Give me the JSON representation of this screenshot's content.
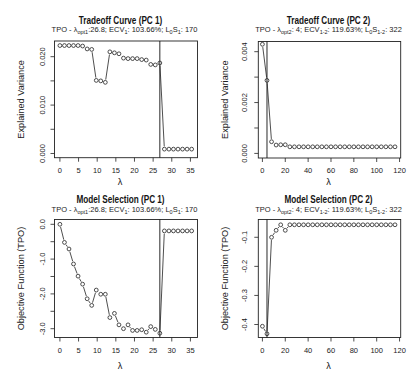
{
  "figure": {
    "background": "#ffffff",
    "ink": "#222222",
    "layout": "2x2 panels"
  },
  "chart_data": [
    {
      "id": "tradeoff-pc1",
      "type": "line",
      "marker": "open-circle",
      "title": "Tradeoff Curve (PC 1)",
      "subtitle_parts": [
        "TPO - λ",
        "opt1",
        ":26.8; ECV",
        "1",
        ": 103.66%; L",
        "0",
        "S",
        "1",
        ": 170"
      ],
      "xlabel": "λ",
      "ylabel": "Explained Variance",
      "x": [
        0,
        1.22,
        2.44,
        3.65,
        4.87,
        6.09,
        7.31,
        8.53,
        9.75,
        10.96,
        12.18,
        13.4,
        14.62,
        15.84,
        17.05,
        18.27,
        19.49,
        20.71,
        21.93,
        23.15,
        24.36,
        25.58,
        26.8,
        28.02,
        29.24,
        30.45,
        31.67,
        32.89,
        34.11,
        35.33
      ],
      "y": [
        0.0223,
        0.0223,
        0.0223,
        0.0223,
        0.0223,
        0.0222,
        0.0216,
        0.0215,
        0.0151,
        0.015,
        0.0147,
        0.021,
        0.0208,
        0.0206,
        0.0197,
        0.0196,
        0.0196,
        0.0196,
        0.0194,
        0.0193,
        0.0184,
        0.0183,
        0.0187,
        0.0009,
        0.0009,
        0.0009,
        0.0009,
        0.0009,
        0.0009,
        0.0009
      ],
      "xlim": [
        -1.45,
        36.9
      ],
      "ylim": [
        -0.00087,
        0.02324
      ],
      "xticks": [
        0,
        5,
        10,
        15,
        20,
        25,
        30,
        35
      ],
      "xtick_labels": [
        "0",
        "5",
        "10",
        "15",
        "20",
        "25",
        "30",
        "35"
      ],
      "yticks": [
        0,
        0.005,
        0.01,
        0.015,
        0.02
      ],
      "ytick_labels": [
        "0.000",
        "",
        "0.010",
        "",
        "0.020"
      ],
      "vline_x": 26.8,
      "grid": false,
      "legend": "none"
    },
    {
      "id": "tradeoff-pc2",
      "type": "line",
      "marker": "open-circle",
      "title": "Tradeoff Curve (PC 2)",
      "subtitle_parts": [
        "TPO - λ",
        "opt2",
        ": 4; ECV",
        "1-2",
        ": 119.63%; L",
        "0",
        "S",
        "1-2",
        ": 322"
      ],
      "xlabel": "λ",
      "ylabel": "Explained Variance",
      "x": [
        0,
        4,
        8,
        12,
        16,
        20,
        24,
        28,
        32,
        36,
        40,
        44,
        48,
        52,
        56,
        60,
        64,
        68,
        72,
        76,
        80,
        84,
        88,
        92,
        96,
        100,
        104,
        108,
        112,
        116
      ],
      "y": [
        0.00429,
        0.00287,
        0.00046,
        0.00033,
        0.00034,
        0.00034,
        0.00026,
        0.00026,
        0.00026,
        0.00026,
        0.00026,
        0.00026,
        0.00026,
        0.00026,
        0.00026,
        0.00026,
        0.00026,
        0.00026,
        0.00026,
        0.00026,
        0.00026,
        0.00026,
        0.00026,
        0.00026,
        0.00026,
        0.00026,
        0.00026,
        0.00026,
        0.00026,
        0.00026
      ],
      "xlim": [
        -3.6,
        121.0
      ],
      "ylim": [
        -0.00018,
        0.0044
      ],
      "xticks": [
        0,
        20,
        40,
        60,
        80,
        100,
        120
      ],
      "xtick_labels": [
        "0",
        "20",
        "40",
        "60",
        "80",
        "100",
        "120"
      ],
      "yticks": [
        0,
        0.001,
        0.002,
        0.003,
        0.004
      ],
      "ytick_labels": [
        "0.000",
        "",
        "0.002",
        "",
        "0.004"
      ],
      "vline_x": 4,
      "grid": false,
      "legend": "none"
    },
    {
      "id": "model-selection-pc1",
      "type": "line",
      "marker": "open-circle",
      "title": "Model Selection (PC 1)",
      "subtitle_parts": [
        "TPO - λ",
        "opt1",
        ":26.8; ECV",
        "1",
        ": 103.66%; L",
        "0",
        "S",
        "1",
        ": 170"
      ],
      "xlabel": "λ",
      "ylabel": "Objective Function (TPO)",
      "x": [
        0,
        1.22,
        2.44,
        3.65,
        4.87,
        6.09,
        7.31,
        8.53,
        9.75,
        10.96,
        12.18,
        13.4,
        14.62,
        15.84,
        17.05,
        18.27,
        19.49,
        20.71,
        21.93,
        23.15,
        24.36,
        25.58,
        26.8,
        28.02,
        29.24,
        30.45,
        31.67,
        32.89,
        34.11,
        35.33
      ],
      "y": [
        0.0,
        -0.52,
        -0.71,
        -1.14,
        -1.49,
        -1.72,
        -2.14,
        -2.33,
        -1.89,
        -2.01,
        -2.01,
        -2.68,
        -2.56,
        -2.89,
        -3.0,
        -2.89,
        -3.05,
        -3.05,
        -3.03,
        -3.1,
        -2.94,
        -3.02,
        -3.13,
        -0.19,
        -0.19,
        -0.19,
        -0.19,
        -0.19,
        -0.19,
        -0.19
      ],
      "xlim": [
        -1.45,
        36.9
      ],
      "ylim": [
        -3.253,
        0.138
      ],
      "xticks": [
        0,
        5,
        10,
        15,
        20,
        25,
        30,
        35
      ],
      "xtick_labels": [
        "0",
        "5",
        "10",
        "15",
        "20",
        "25",
        "30",
        "35"
      ],
      "yticks": [
        0,
        -0.5,
        -1.0,
        -1.5,
        -2.0,
        -2.5,
        -3.0
      ],
      "ytick_labels": [
        "0.0",
        "",
        "-1.0",
        "",
        "-2.0",
        "",
        "-3.0"
      ],
      "vline_x": 26.8,
      "grid": false,
      "legend": "none"
    },
    {
      "id": "model-selection-pc2",
      "type": "line",
      "marker": "open-circle",
      "title": "Model Selection (PC 2)",
      "subtitle_parts": [
        "TPO - λ",
        "opt2",
        ": 4; ECV",
        "1-2",
        ": 119.63%; L",
        "0",
        "S",
        "1-2",
        ": 322"
      ],
      "xlabel": "λ",
      "ylabel": "Objective Function (TPO)",
      "x": [
        0,
        4,
        8,
        12,
        16,
        20,
        24,
        28,
        32,
        36,
        40,
        44,
        48,
        52,
        56,
        60,
        64,
        68,
        72,
        76,
        80,
        84,
        88,
        92,
        96,
        100,
        104,
        108,
        112,
        116
      ],
      "y": [
        -0.406,
        -0.432,
        -0.1,
        -0.076,
        -0.057,
        -0.076,
        -0.057,
        -0.057,
        -0.057,
        -0.057,
        -0.057,
        -0.057,
        -0.057,
        -0.057,
        -0.057,
        -0.057,
        -0.057,
        -0.057,
        -0.057,
        -0.057,
        -0.057,
        -0.057,
        -0.057,
        -0.057,
        -0.057,
        -0.057,
        -0.057,
        -0.057,
        -0.057,
        -0.057
      ],
      "xlim": [
        -3.6,
        121.0
      ],
      "ylim": [
        -0.4447,
        -0.0388
      ],
      "xticks": [
        0,
        20,
        40,
        60,
        80,
        100,
        120
      ],
      "xtick_labels": [
        "0",
        "20",
        "40",
        "60",
        "80",
        "100",
        "120"
      ],
      "yticks": [
        -0.1,
        -0.2,
        -0.3,
        -0.4
      ],
      "ytick_labels": [
        "-0.1",
        "-0.2",
        "-0.3",
        "-0.4"
      ],
      "vline_x": 4,
      "grid": false,
      "legend": "none"
    }
  ]
}
